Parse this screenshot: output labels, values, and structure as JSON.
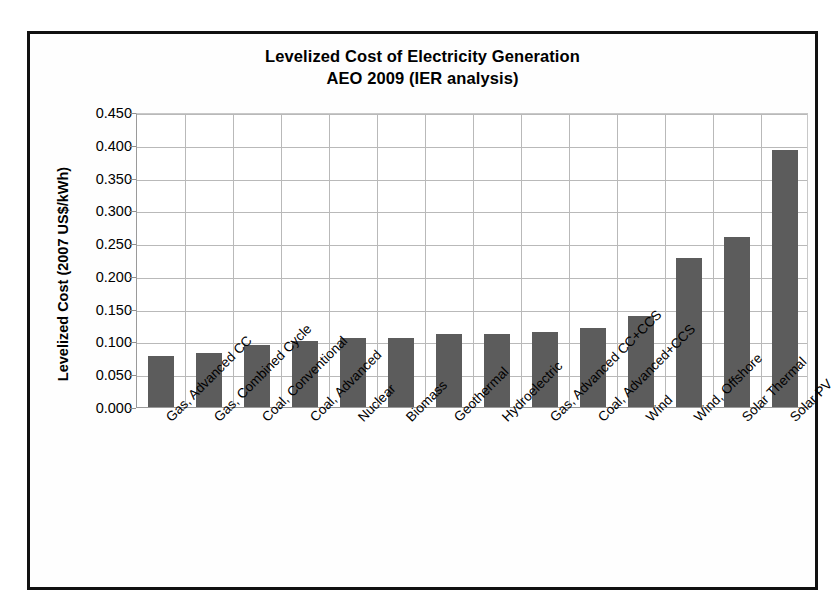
{
  "chart_data": {
    "type": "bar",
    "title": "Levelized Cost of Electricity Generation",
    "subtitle": "AEO 2009 (IER analysis)",
    "xlabel": "",
    "ylabel": "Levelized Cost (2007 US$/kWh)",
    "ylim": [
      0.0,
      0.45
    ],
    "ytick_labels": [
      "0.450",
      "0.400",
      "0.350",
      "0.300",
      "0.250",
      "0.200",
      "0.150",
      "0.100",
      "0.050",
      "0.000"
    ],
    "ytick_values": [
      0.45,
      0.4,
      0.35,
      0.3,
      0.25,
      0.2,
      0.15,
      0.1,
      0.05,
      0.0
    ],
    "grid": true,
    "legend": "none",
    "bar_color": "#5c5c5c",
    "categories": [
      "Gas, Advanced CC",
      "Gas, Combined Cycle",
      "Coal, Conventional",
      "Coal, Advanced",
      "Nuclear",
      "Biomass",
      "Geothermal",
      "Hydroelectric",
      "Gas, Advanced CC+CCS",
      "Coal, Advanced+CCS",
      "Wind",
      "Wind, Offshore",
      "Solar Thermal",
      "Solar PV"
    ],
    "values": [
      0.078,
      0.082,
      0.094,
      0.101,
      0.106,
      0.106,
      0.111,
      0.112,
      0.114,
      0.12,
      0.139,
      0.228,
      0.26,
      0.392
    ]
  }
}
